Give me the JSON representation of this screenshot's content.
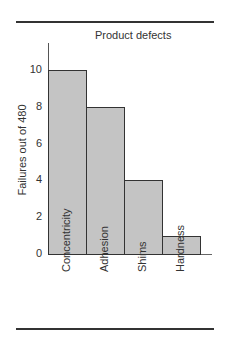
{
  "chart_data": {
    "type": "bar",
    "title": "Product defects",
    "xlabel": "",
    "ylabel": "Failures out of 480",
    "categories": [
      "Concentricity",
      "Adhesion",
      "Shims",
      "Hardness"
    ],
    "values": [
      10,
      8,
      4,
      1
    ],
    "ylim": [
      0,
      11
    ],
    "yticks": [
      0,
      2,
      4,
      6,
      8,
      10
    ],
    "grid": false,
    "legend": null,
    "bar_color": "#c4c4c4",
    "edge_color": "#333333"
  }
}
